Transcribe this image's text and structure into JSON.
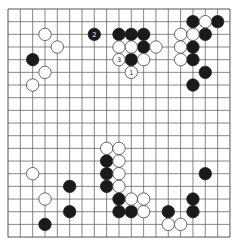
{
  "board": {
    "size": 19,
    "origin_x": 8,
    "origin_y": 9,
    "step_x": 12.33,
    "step_y": 12.67,
    "stone_radius": 6.2,
    "line_color": "#555555",
    "black_color": "#1a1a1a",
    "white_color": "#ffffff"
  },
  "stones": {
    "black": [
      {
        "c": 7,
        "r": 2,
        "label": "2"
      },
      {
        "c": 9,
        "r": 2
      },
      {
        "c": 10,
        "r": 2
      },
      {
        "c": 11,
        "r": 2
      },
      {
        "c": 11,
        "r": 3
      },
      {
        "c": 10,
        "r": 4
      },
      {
        "c": 15,
        "r": 1
      },
      {
        "c": 17,
        "r": 1
      },
      {
        "c": 16,
        "r": 2
      },
      {
        "c": 15,
        "r": 3
      },
      {
        "c": 15,
        "r": 4
      },
      {
        "c": 16,
        "r": 5
      },
      {
        "c": 15,
        "r": 6
      },
      {
        "c": 2,
        "r": 4
      },
      {
        "c": 8,
        "r": 12
      },
      {
        "c": 8,
        "r": 13
      },
      {
        "c": 8,
        "r": 14
      },
      {
        "c": 9,
        "r": 15
      },
      {
        "c": 9,
        "r": 16
      },
      {
        "c": 10,
        "r": 16
      },
      {
        "c": 13,
        "r": 16
      },
      {
        "c": 15,
        "r": 15
      },
      {
        "c": 15,
        "r": 16
      },
      {
        "c": 16,
        "r": 13
      },
      {
        "c": 5,
        "r": 14
      },
      {
        "c": 5,
        "r": 16
      },
      {
        "c": 3,
        "r": 17
      }
    ],
    "white": [
      {
        "c": 9,
        "r": 3
      },
      {
        "c": 10,
        "r": 3
      },
      {
        "c": 12,
        "r": 3
      },
      {
        "c": 9,
        "r": 4,
        "label": "3"
      },
      {
        "c": 11,
        "r": 4
      },
      {
        "c": 10,
        "r": 5,
        "label": "1"
      },
      {
        "c": 16,
        "r": 1
      },
      {
        "c": 14,
        "r": 2
      },
      {
        "c": 15,
        "r": 2
      },
      {
        "c": 14,
        "r": 3
      },
      {
        "c": 14,
        "r": 4
      },
      {
        "c": 3,
        "r": 2
      },
      {
        "c": 4,
        "r": 3
      },
      {
        "c": 3,
        "r": 5
      },
      {
        "c": 2,
        "r": 6
      },
      {
        "c": 8,
        "r": 11
      },
      {
        "c": 9,
        "r": 11
      },
      {
        "c": 9,
        "r": 12
      },
      {
        "c": 9,
        "r": 13
      },
      {
        "c": 9,
        "r": 14
      },
      {
        "c": 10,
        "r": 15
      },
      {
        "c": 11,
        "r": 15
      },
      {
        "c": 11,
        "r": 16
      },
      {
        "c": 13,
        "r": 17
      },
      {
        "c": 14,
        "r": 17
      },
      {
        "c": 2,
        "r": 13
      },
      {
        "c": 3,
        "r": 15
      }
    ]
  }
}
